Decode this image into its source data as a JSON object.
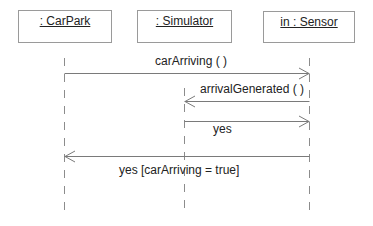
{
  "diagram": {
    "type": "sequence",
    "objects": [
      {
        "id": "carpark",
        "label": ": CarPark"
      },
      {
        "id": "simulator",
        "label": ": Simulator"
      },
      {
        "id": "sensor",
        "label": "in : Sensor"
      }
    ],
    "messages": [
      {
        "from": "carpark",
        "to": "sensor",
        "label": "carArriving ( )"
      },
      {
        "from": "sensor",
        "to": "simulator",
        "label": "arrivalGenerated ( )"
      },
      {
        "from": "simulator",
        "to": "sensor",
        "label": "yes"
      },
      {
        "from": "sensor",
        "to": "carpark",
        "label": "yes [carArriving = true]"
      }
    ]
  }
}
